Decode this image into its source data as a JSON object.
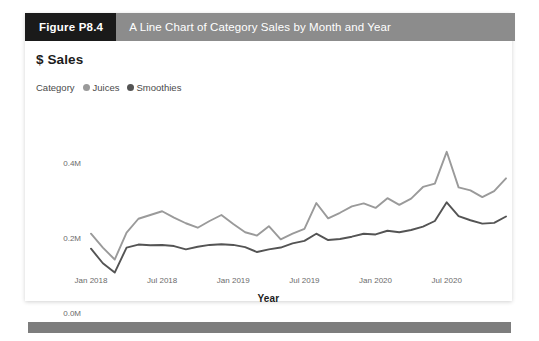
{
  "figure": {
    "number_label": "Figure P8.4",
    "caption": "A Line Chart of Category Sales by Month and Year"
  },
  "chart": {
    "title": "$ Sales",
    "legend": {
      "title": "Category",
      "items": [
        {
          "label": "Juices",
          "color": "#9a9a9a"
        },
        {
          "label": "Smoothies",
          "color": "#545454"
        }
      ]
    },
    "axis_title_x": "Year"
  },
  "chart_data": {
    "type": "line",
    "title": "$ Sales",
    "xlabel": "Year",
    "ylabel": "",
    "ylim": [
      0,
      500000
    ],
    "yticks": [
      0,
      200000,
      400000
    ],
    "ytick_labels": [
      "0.0M",
      "0.2M",
      "0.4M"
    ],
    "grid": false,
    "legend_position": "top-left",
    "x": [
      "Jan 2018",
      "Feb 2018",
      "Mar 2018",
      "Apr 2018",
      "May 2018",
      "Jun 2018",
      "Jul 2018",
      "Aug 2018",
      "Sep 2018",
      "Oct 2018",
      "Nov 2018",
      "Dec 2018",
      "Jan 2019",
      "Feb 2019",
      "Mar 2019",
      "Apr 2019",
      "May 2019",
      "Jun 2019",
      "Jul 2019",
      "Aug 2019",
      "Sep 2019",
      "Oct 2019",
      "Nov 2019",
      "Dec 2019",
      "Jan 2020",
      "Feb 2020",
      "Mar 2020",
      "Apr 2020",
      "May 2020",
      "Jun 2020",
      "Jul 2020",
      "Aug 2020",
      "Sep 2020",
      "Oct 2020",
      "Nov 2020",
      "Dec 2020"
    ],
    "xtick_labels": [
      "Jan 2018",
      "Jul 2018",
      "Jan 2019",
      "Jul 2019",
      "Jan 2020",
      "Jul 2020"
    ],
    "xtick_indices": [
      0,
      6,
      12,
      18,
      24,
      30
    ],
    "series": [
      {
        "name": "Juices",
        "color": "#9a9a9a",
        "values": [
          212000,
          175000,
          143000,
          215000,
          252000,
          262000,
          272000,
          255000,
          240000,
          228000,
          246000,
          262000,
          238000,
          216000,
          207000,
          232000,
          197000,
          212000,
          225000,
          294000,
          253000,
          268000,
          285000,
          293000,
          281000,
          307000,
          289000,
          306000,
          337000,
          346000,
          431000,
          336000,
          328000,
          310000,
          326000,
          360000
        ]
      },
      {
        "name": "Smoothies",
        "color": "#545454",
        "values": [
          172000,
          133000,
          108000,
          175000,
          183000,
          181000,
          182000,
          179000,
          170000,
          177000,
          182000,
          184000,
          182000,
          176000,
          163000,
          170000,
          175000,
          186000,
          193000,
          212000,
          195000,
          198000,
          204000,
          212000,
          210000,
          220000,
          216000,
          222000,
          231000,
          246000,
          296000,
          259000,
          248000,
          239000,
          241000,
          258000
        ]
      }
    ]
  }
}
